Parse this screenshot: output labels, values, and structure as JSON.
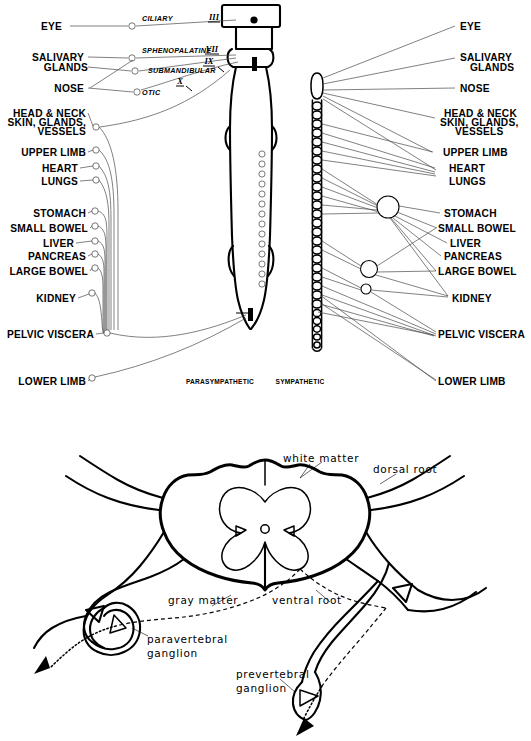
{
  "figure": {
    "title_top": "Autonomic nervous system outflow",
    "title_bottom": "Spinal cord cross-section with sympathetic ganglia"
  },
  "top_diagram": {
    "column_labels": {
      "parasympathetic": "PARASYMPATHETIC",
      "sympathetic": "SYMPATHETIC"
    },
    "left_targets": [
      {
        "label": "EYE",
        "x": 62,
        "y": 26
      },
      {
        "label": "SALIVARY",
        "x": 82,
        "y": 57
      },
      {
        "label": "GLANDS",
        "x": 82,
        "y": 67
      },
      {
        "label": "NOSE",
        "x": 62,
        "y": 88
      },
      {
        "label": "HEAD & NECK",
        "x": 78,
        "y": 113
      },
      {
        "label": "SKIN, GLANDS,",
        "x": 82,
        "y": 122
      },
      {
        "label": "VESSELS",
        "x": 84,
        "y": 131
      },
      {
        "label": "UPPER LIMB",
        "x": 82,
        "y": 152
      },
      {
        "label": "HEART",
        "x": 70,
        "y": 168
      },
      {
        "label": "LUNGS",
        "x": 70,
        "y": 181
      },
      {
        "label": "STOMACH",
        "x": 80,
        "y": 213
      },
      {
        "label": "SMALL BOWEL",
        "x": 83,
        "y": 228
      },
      {
        "label": "LIVER",
        "x": 68,
        "y": 243
      },
      {
        "label": "PANCREAS",
        "x": 80,
        "y": 256
      },
      {
        "label": "LARGE BOWEL",
        "x": 83,
        "y": 271
      },
      {
        "label": "KIDNEY",
        "x": 70,
        "y": 298
      },
      {
        "label": "PELVIC VISCERA",
        "x": 88,
        "y": 334
      },
      {
        "label": "LOWER LIMB",
        "x": 80,
        "y": 381
      }
    ],
    "right_targets": [
      {
        "label": "EYE",
        "x": 464,
        "y": 26
      },
      {
        "label": "SALIVARY",
        "x": 464,
        "y": 57
      },
      {
        "label": "GLANDS",
        "x": 474,
        "y": 67
      },
      {
        "label": "NOSE",
        "x": 464,
        "y": 88
      },
      {
        "label": "HEAD & NECK",
        "x": 444,
        "y": 113
      },
      {
        "label": "SKIN, GLANDS,",
        "x": 441,
        "y": 122
      },
      {
        "label": "VESSELS",
        "x": 455,
        "y": 131
      },
      {
        "label": "UPPER LIMB",
        "x": 447,
        "y": 152
      },
      {
        "label": "HEART",
        "x": 451,
        "y": 168
      },
      {
        "label": "LUNGS",
        "x": 451,
        "y": 181
      },
      {
        "label": "STOMACH",
        "x": 447,
        "y": 213
      },
      {
        "label": "SMALL BOWEL",
        "x": 441,
        "y": 228
      },
      {
        "label": "LIVER",
        "x": 452,
        "y": 243
      },
      {
        "label": "PANCREAS",
        "x": 447,
        "y": 256
      },
      {
        "label": "LARGE BOWEL",
        "x": 441,
        "y": 271
      },
      {
        "label": "KIDNEY",
        "x": 455,
        "y": 298
      },
      {
        "label": "PELVIC VISCERA",
        "x": 441,
        "y": 334
      },
      {
        "label": "LOWER LIMB",
        "x": 441,
        "y": 381
      }
    ],
    "cranial_nerves": [
      {
        "name": "CILIARY",
        "x": 117,
        "y": 21
      },
      {
        "name": "SPHENOPALATINE",
        "x": 117,
        "y": 53
      },
      {
        "name": "SUBMANDIBULAR",
        "x": 122,
        "y": 73
      },
      {
        "name": "OTIC",
        "x": 113,
        "y": 90
      }
    ],
    "roman_numerals": [
      {
        "numeral": "III",
        "x": 214,
        "y": 22
      },
      {
        "numeral": "VII",
        "x": 212,
        "y": 54
      },
      {
        "numeral": "IX",
        "x": 209,
        "y": 66
      },
      {
        "numeral": "X",
        "x": 180,
        "y": 86
      }
    ]
  },
  "bottom_diagram": {
    "labels": [
      {
        "text": "white matter",
        "x": 283,
        "y": 460
      },
      {
        "text": "dorsal root",
        "x": 375,
        "y": 471
      },
      {
        "text": "gray matter",
        "x": 168,
        "y": 601
      },
      {
        "text": "ventral root",
        "x": 275,
        "y": 601
      },
      {
        "text": "paravertebral",
        "x": 145,
        "y": 641
      },
      {
        "text": "ganglion",
        "x": 145,
        "y": 655
      },
      {
        "text": "prevertebral",
        "x": 237,
        "y": 677
      },
      {
        "text": "ganglion",
        "x": 237,
        "y": 691
      }
    ]
  },
  "colors": {
    "ink": "#000000",
    "leader": "#4a4a4a",
    "background": "#ffffff",
    "gray_matter_stipple": "#bdbdbd"
  }
}
